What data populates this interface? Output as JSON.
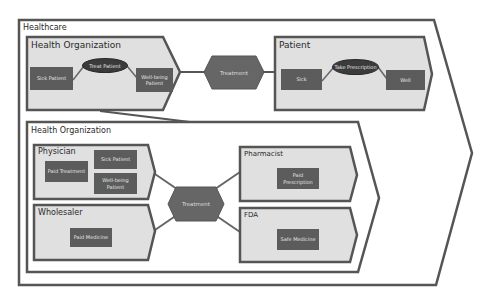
{
  "colors": {
    "frame_stroke": "#555555",
    "panel_fill": "#e0e0e0",
    "box_fill": "#5c5c5c",
    "oval_fill": "#3b3b3b",
    "hexagon_fill": "#666666",
    "background": "#ffffff"
  },
  "healthcare": {
    "title": "Healthcare"
  },
  "top_health_org": {
    "title": "Health Organization",
    "sick_patient": "Sick Patient",
    "action": "Treat Patient",
    "well_being_patient": "Well-being Patient"
  },
  "top_connector": {
    "label": "Treatment"
  },
  "patient": {
    "title": "Patient",
    "sick": "Sick",
    "action": "Take Prescription",
    "well": "Well"
  },
  "inner_health_org": {
    "title": "Health Organization",
    "physician": {
      "title": "Physician",
      "paid_treatment": "Paid Treatment",
      "sick_patient": "Sick Patient",
      "well_being_patient": "Well-being Patient"
    },
    "wholesaler": {
      "title": "Wholesaler",
      "paid_medicine": "Paid Medicine"
    },
    "center_connector": {
      "label": "Treatment"
    },
    "pharmacist": {
      "title": "Pharmacist",
      "paid_prescription": "Paid Prescription"
    },
    "fda": {
      "title": "FDA",
      "safe_medicine": "Safe Medicine"
    }
  }
}
